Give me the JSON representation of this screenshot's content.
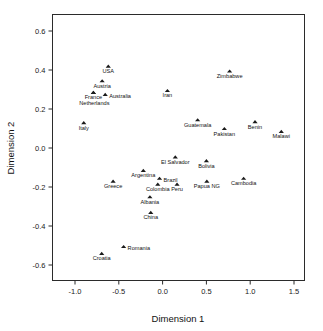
{
  "chart_data": {
    "type": "scatter",
    "title": "",
    "subtitle": "",
    "xlabel": "Dimension 1",
    "ylabel": "Dimension 2",
    "xlim": [
      -1.15,
      1.6
    ],
    "ylim": [
      -0.68,
      0.66
    ],
    "xticks": [
      "-1.0",
      "-0.5",
      "0.0",
      "0.5",
      "1.0",
      "1.5"
    ],
    "xtick_values": [
      -1.0,
      -0.5,
      0.0,
      0.5,
      1.0,
      1.5
    ],
    "yticks": [
      "0.6",
      "0.4",
      "0.2",
      "0.0",
      "-0.2",
      "-0.4",
      "-0.6"
    ],
    "ytick_values": [
      0.6,
      0.4,
      0.2,
      0.0,
      -0.2,
      -0.4,
      -0.6
    ],
    "grid": false,
    "legend": false,
    "legend_position": "none",
    "marker_shape": "triangle",
    "marker_color": "#1a1a1a",
    "series": [
      {
        "name": "Countries",
        "points": [
          {
            "label": "USA",
            "x": -0.62,
            "y": 0.42,
            "label_pos": "below"
          },
          {
            "label": "Austria",
            "x": -0.69,
            "y": 0.345,
            "label_pos": "below"
          },
          {
            "label": "France",
            "x": -0.79,
            "y": 0.285,
            "label_pos": "below"
          },
          {
            "label": "Australia",
            "x": -0.655,
            "y": 0.275,
            "label_pos": "right"
          },
          {
            "label": "Netherlands",
            "x": -0.79,
            "y": 0.285,
            "label_pos": "below2"
          },
          {
            "label": "Italy",
            "x": -0.9,
            "y": 0.13,
            "label_pos": "below"
          },
          {
            "label": "Iran",
            "x": 0.055,
            "y": 0.295,
            "label_pos": "below"
          },
          {
            "label": "Zimbabwe",
            "x": 0.765,
            "y": 0.395,
            "label_pos": "below"
          },
          {
            "label": "Guatemala",
            "x": 0.4,
            "y": 0.145,
            "label_pos": "below"
          },
          {
            "label": "Pakistan",
            "x": 0.705,
            "y": 0.1,
            "label_pos": "below"
          },
          {
            "label": "Benin",
            "x": 1.055,
            "y": 0.135,
            "label_pos": "below"
          },
          {
            "label": "Malawi",
            "x": 1.355,
            "y": 0.085,
            "label_pos": "below"
          },
          {
            "label": "El Salvador",
            "x": 0.145,
            "y": -0.045,
            "label_pos": "below"
          },
          {
            "label": "Bolivia",
            "x": 0.5,
            "y": -0.065,
            "label_pos": "below"
          },
          {
            "label": "Argentina",
            "x": -0.22,
            "y": -0.115,
            "label_pos": "below"
          },
          {
            "label": "Cambodia",
            "x": 0.925,
            "y": -0.155,
            "label_pos": "below"
          },
          {
            "label": "Brazil",
            "x": -0.035,
            "y": -0.155,
            "label_pos": "right"
          },
          {
            "label": "Greece",
            "x": -0.565,
            "y": -0.17,
            "label_pos": "below"
          },
          {
            "label": "Papua NG",
            "x": 0.505,
            "y": -0.17,
            "label_pos": "below"
          },
          {
            "label": "Peru",
            "x": 0.165,
            "y": -0.185,
            "label_pos": "below"
          },
          {
            "label": "Colombia",
            "x": -0.055,
            "y": -0.185,
            "label_pos": "below"
          },
          {
            "label": "Albania",
            "x": -0.145,
            "y": -0.25,
            "label_pos": "below"
          },
          {
            "label": "China",
            "x": -0.135,
            "y": -0.33,
            "label_pos": "below"
          },
          {
            "label": "Romania",
            "x": -0.445,
            "y": -0.505,
            "label_pos": "right"
          },
          {
            "label": "Croatia",
            "x": -0.695,
            "y": -0.54,
            "label_pos": "below"
          }
        ]
      }
    ]
  }
}
